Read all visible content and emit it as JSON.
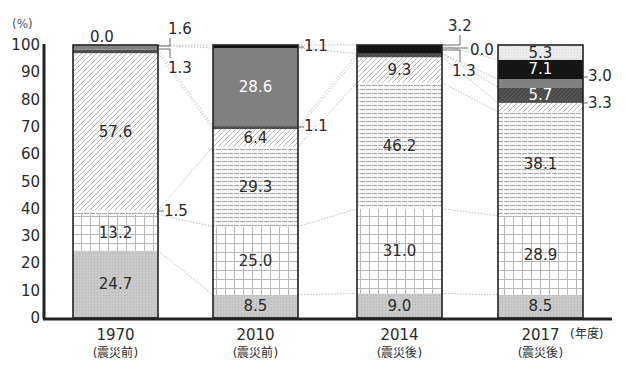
{
  "chart_data": {
    "type": "bar",
    "stacked": true,
    "title": "",
    "ylabel": "(%)",
    "xlabel": "(年度)",
    "ylim": [
      0,
      100
    ],
    "yticks": [
      0,
      10,
      20,
      30,
      40,
      50,
      60,
      70,
      80,
      90,
      100
    ],
    "categories": [
      "1970",
      "2010",
      "2014",
      "2017"
    ],
    "category_sublabels": [
      "(震災前)",
      "(震災前)",
      "(震災後)",
      "(震災後)"
    ],
    "series": [
      {
        "name": "series-1 (gray dotted)",
        "pattern": "dots",
        "values": [
          24.7,
          8.5,
          9.0,
          8.5
        ]
      },
      {
        "name": "series-2 (grid)",
        "pattern": "grid",
        "values": [
          13.2,
          25.0,
          31.0,
          28.9
        ]
      },
      {
        "name": "series-3 (horizontal lines)",
        "pattern": "hlines",
        "values": [
          1.5,
          29.3,
          46.2,
          38.1
        ]
      },
      {
        "name": "series-4 (diagonal hatch)",
        "pattern": "diag",
        "values": [
          57.6,
          6.4,
          9.3,
          3.3
        ]
      },
      {
        "name": "series-5 (dark pattern)",
        "pattern": "dark",
        "values": [
          1.3,
          1.1,
          1.3,
          5.7
        ]
      },
      {
        "name": "series-6 (medium gray)",
        "pattern": "midgray",
        "values": [
          1.6,
          28.6,
          0.0,
          3.0
        ]
      },
      {
        "name": "series-7 (black)",
        "pattern": "black",
        "values": [
          0.0,
          1.1,
          3.2,
          7.1
        ]
      },
      {
        "name": "series-8 (light dotted)",
        "pattern": "light",
        "values": [
          null,
          null,
          0.0,
          5.3
        ]
      }
    ],
    "grid": false,
    "legend": "none",
    "connector_lines": "dotted lines between matching segment boundaries of adjacent bars"
  },
  "labels": {
    "y_unit": "(%)",
    "x_unit": "(年度)"
  }
}
